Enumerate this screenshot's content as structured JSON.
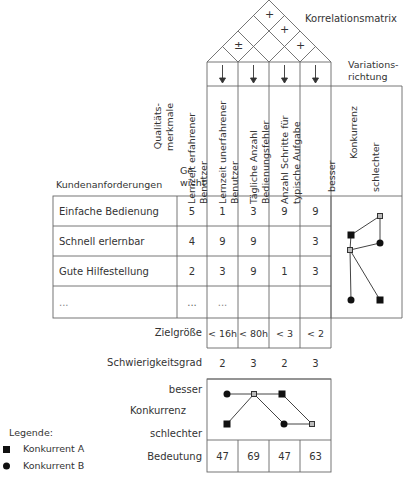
{
  "roof": {
    "title": "Korrelationsmatrix",
    "correlations": [
      {
        "pair": "1-4",
        "symbol": "+"
      },
      {
        "pair": "2-4",
        "symbol": "+"
      },
      {
        "pair": "3-4",
        "symbol": "+"
      },
      {
        "pair": "1-2",
        "symbol": "±"
      }
    ]
  },
  "variation": {
    "title_line1": "Variations-",
    "title_line2": "richtung"
  },
  "headers": {
    "customer_requirements": "Kundenanforderungen",
    "quality_features_line1": "Qualitäts-",
    "quality_features_line2": "merkmale",
    "weight_line1": "Ge-",
    "weight_line2": "wicht",
    "columns": [
      {
        "line1": "Lernzeit erfahrener",
        "line2": "Benutzer"
      },
      {
        "line1": "Lernzeit unerfahrener",
        "line2": "Benutzer"
      },
      {
        "line1": "Tägliche Anzahl",
        "line2": "Bedienungsfehler"
      },
      {
        "line1": "Anzahl Schritte für",
        "line2": "typische Aufgabe"
      }
    ],
    "competition": {
      "better": "besser",
      "label": "Konkurrenz",
      "worse": "schlechter"
    }
  },
  "rows": [
    {
      "requirement": "Einfache Bedienung",
      "weight": "5",
      "values": [
        "1",
        "3",
        "9",
        "9"
      ]
    },
    {
      "requirement": "Schnell erlernbar",
      "weight": "4",
      "values": [
        "9",
        "9",
        "",
        "3"
      ]
    },
    {
      "requirement": "Gute Hilfestellung",
      "weight": "2",
      "values": [
        "3",
        "9",
        "1",
        "3"
      ]
    },
    {
      "requirement": "...",
      "weight": "...",
      "values": [
        "...",
        "",
        "",
        ""
      ]
    }
  ],
  "bottom": {
    "target": {
      "label": "Zielgröße",
      "values": [
        "< 16h",
        "< 80h",
        "< 3",
        "< 2"
      ]
    },
    "difficulty": {
      "label": "Schwierigkeitsgrad",
      "values": [
        "2",
        "3",
        "2",
        "3"
      ]
    },
    "competition": {
      "better": "besser",
      "label": "Konkurrenz",
      "worse": "schlechter"
    },
    "importance": {
      "label": "Bedeutung",
      "values": [
        "47",
        "69",
        "47",
        "63"
      ]
    }
  },
  "legend": {
    "title": "Legende:",
    "items": [
      {
        "marker": "square",
        "label": "Konkurrent A"
      },
      {
        "marker": "circle",
        "label": "Konkurrent B"
      }
    ]
  },
  "colors": {
    "gray_cell": "#a9a9a9",
    "line": "#555555"
  }
}
